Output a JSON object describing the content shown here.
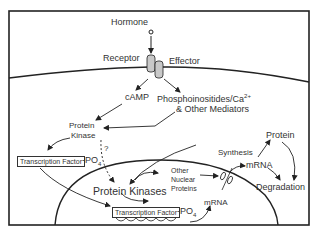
{
  "diagram": {
    "labels": {
      "hormone": "Hormone",
      "receptor": "Receptor",
      "effector": "Effector",
      "camp": "cAMP",
      "phospho_line1": "Phosphoinositides/Ca",
      "phospho_sup": "2+",
      "phospho_line2": "& Other Mediators",
      "protein_kinase_line1": "Protein",
      "protein_kinase_line2": "Kinase",
      "question": "?",
      "tf_cyto": "Transcription Factor",
      "po4_cyto": "-PO",
      "po4_sub": "4",
      "protein_kinases": "Protein Kinases",
      "other_nuclear_1": "Other",
      "other_nuclear_2": "Nuclear",
      "other_nuclear_3": "Proteins",
      "tf_nuc": "Transcription Factor",
      "po4_nuc": "-PO",
      "po4_nuc_sub": "4",
      "mrna_nuc": "mRNA",
      "mrna_cyto": "mRNA",
      "synthesis": "Synthesis",
      "protein": "Protein",
      "degradation": "Degradation"
    },
    "colors": {
      "line": "#222222",
      "receptor_fill": "#c8c8c8",
      "text": "#333333"
    }
  }
}
